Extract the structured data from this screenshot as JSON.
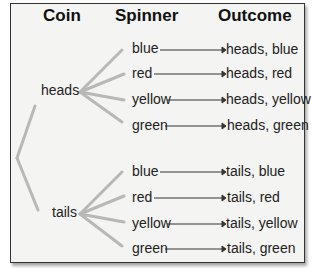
{
  "headers": {
    "coin": "Coin",
    "spinner": "Spinner",
    "outcome": "Outcome"
  },
  "coins": [
    {
      "label": "heads",
      "spins": [
        "blue",
        "red",
        "yellow",
        "green"
      ],
      "outcomes": [
        "heads, blue",
        "heads, red",
        "heads, yellow",
        "heads, green"
      ]
    },
    {
      "label": "tails",
      "spins": [
        "blue",
        "red",
        "yellow",
        "green"
      ],
      "outcomes": [
        "tails, blue",
        "tails, red",
        "tails, yellow",
        "tails, green"
      ]
    }
  ],
  "colors": {
    "branch": "#b8b8b8",
    "frame": "#333333",
    "background": "#f4f4f2"
  }
}
